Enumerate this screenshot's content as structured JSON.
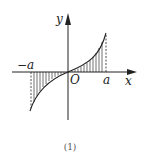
{
  "diagram": {
    "labels": {
      "y_axis": "y",
      "x_axis": "x",
      "origin": "O",
      "neg_a": "−a",
      "pos_a": "a"
    },
    "caption": "(1)",
    "colors": {
      "stroke": "#222222",
      "background": "#ffffff"
    }
  }
}
